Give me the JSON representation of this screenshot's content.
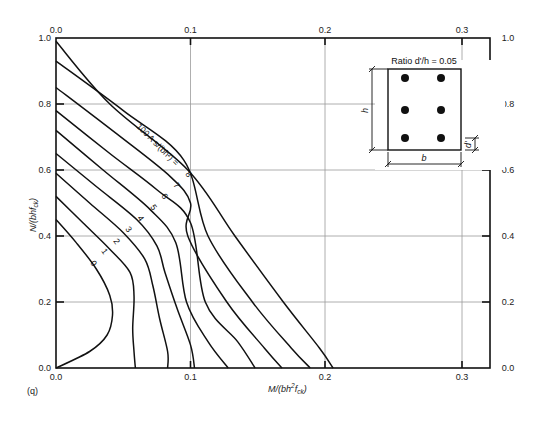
{
  "figure_label": "(q)",
  "chart_data": {
    "type": "line",
    "title": "",
    "xlabel": "M/(bh²f_ck)",
    "ylabel": "N/(bhf_ck)",
    "xlim": [
      0.0,
      0.325
    ],
    "ylim": [
      0.0,
      1.0
    ],
    "x_ticks": [
      0.0,
      0.1,
      0.2,
      0.3
    ],
    "y_ticks": [
      0.0,
      0.2,
      0.4,
      0.6,
      0.8,
      1.0
    ],
    "grid": true,
    "curve_family_label": "100 As/(bh²) =",
    "series": [
      {
        "name": "0",
        "points": [
          [
            0.0,
            0.45
          ],
          [
            0.015,
            0.38
          ],
          [
            0.03,
            0.3
          ],
          [
            0.04,
            0.22
          ],
          [
            0.042,
            0.16
          ],
          [
            0.038,
            0.1
          ],
          [
            0.025,
            0.05
          ],
          [
            0.0,
            0.0
          ]
        ]
      },
      {
        "name": "1",
        "points": [
          [
            0.0,
            0.52
          ],
          [
            0.02,
            0.44
          ],
          [
            0.04,
            0.36
          ],
          [
            0.055,
            0.29
          ],
          [
            0.058,
            0.22
          ],
          [
            0.057,
            0.12
          ],
          [
            0.058,
            0.05
          ],
          [
            0.059,
            0.0
          ]
        ]
      },
      {
        "name": "2",
        "points": [
          [
            0.0,
            0.59
          ],
          [
            0.025,
            0.5
          ],
          [
            0.05,
            0.41
          ],
          [
            0.066,
            0.33
          ],
          [
            0.072,
            0.25
          ],
          [
            0.077,
            0.15
          ],
          [
            0.083,
            0.05
          ],
          [
            0.083,
            0.0
          ]
        ]
      },
      {
        "name": "3",
        "points": [
          [
            0.0,
            0.65
          ],
          [
            0.03,
            0.55
          ],
          [
            0.06,
            0.45
          ],
          [
            0.075,
            0.37
          ],
          [
            0.081,
            0.29
          ],
          [
            0.09,
            0.18
          ],
          [
            0.1,
            0.07
          ],
          [
            0.103,
            0.0
          ]
        ]
      },
      {
        "name": "4",
        "points": [
          [
            0.0,
            0.72
          ],
          [
            0.035,
            0.6
          ],
          [
            0.07,
            0.48
          ],
          [
            0.089,
            0.38
          ],
          [
            0.097,
            0.2
          ],
          [
            0.113,
            0.08
          ],
          [
            0.128,
            0.0
          ]
        ]
      },
      {
        "name": "5",
        "points": [
          [
            0.0,
            0.78
          ],
          [
            0.04,
            0.65
          ],
          [
            0.075,
            0.54
          ],
          [
            0.1,
            0.44
          ],
          [
            0.111,
            0.2
          ],
          [
            0.135,
            0.08
          ],
          [
            0.148,
            0.0
          ]
        ]
      },
      {
        "name": "6",
        "points": [
          [
            0.0,
            0.85
          ],
          [
            0.045,
            0.71
          ],
          [
            0.085,
            0.58
          ],
          [
            0.1,
            0.5
          ],
          [
            0.098,
            0.4
          ],
          [
            0.127,
            0.2
          ],
          [
            0.155,
            0.06
          ],
          [
            0.168,
            0.0
          ]
        ]
      },
      {
        "name": "7",
        "points": [
          [
            0.0,
            0.93
          ],
          [
            0.05,
            0.78
          ],
          [
            0.095,
            0.63
          ],
          [
            0.113,
            0.4
          ],
          [
            0.146,
            0.2
          ],
          [
            0.175,
            0.06
          ],
          [
            0.189,
            0.0
          ]
        ]
      },
      {
        "name": "8",
        "points": [
          [
            0.0,
            0.99
          ],
          [
            0.04,
            0.8
          ],
          [
            0.098,
            0.6
          ],
          [
            0.133,
            0.4
          ],
          [
            0.169,
            0.2
          ],
          [
            0.196,
            0.06
          ],
          [
            0.206,
            0.0
          ]
        ]
      }
    ]
  },
  "axes": {
    "bottom_ticks": [
      "0.0",
      "0.1",
      "0.2",
      "0.3"
    ],
    "top_ticks": [
      "0.0",
      "0.1",
      "0.2",
      "0.3"
    ],
    "left_ticks": [
      "0.0",
      "0.2",
      "0.4",
      "0.6",
      "0.8",
      "1.0"
    ],
    "right_ticks": [
      "0.0",
      "0.2",
      "0.4",
      "0.6",
      "0.8",
      "1.0"
    ],
    "x_title_main": "M/(bh",
    "x_title_sup": "2",
    "x_title_end": "f",
    "x_title_sub": "ck",
    "x_title_close": ")",
    "y_title_main": "N/(bhf",
    "y_title_sub": "ck",
    "y_title_close": ")"
  },
  "curve_labels": [
    "0",
    "1",
    "2",
    "3",
    "4",
    "5",
    "6",
    "7",
    "8"
  ],
  "family_label": "100 A s/(bh²) =",
  "inset": {
    "ratio_label": "Ratio d'/h = 0.05",
    "h_label": "h",
    "b_label": "b",
    "d_label": "d'"
  }
}
